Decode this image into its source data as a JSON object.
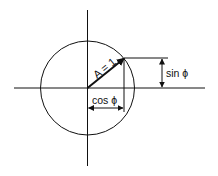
{
  "diagram": {
    "type": "unit-circle-phasor",
    "labels": {
      "vector": "A = 1",
      "sin": "sin ϕ",
      "cos": "cos ϕ"
    },
    "colors": {
      "stroke": "#111111",
      "background": "#ffffff"
    }
  }
}
